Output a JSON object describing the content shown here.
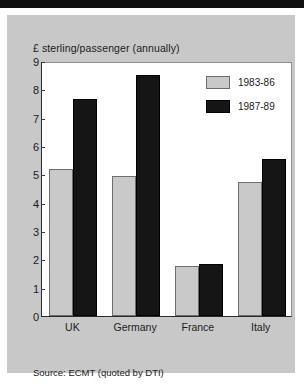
{
  "figure": {
    "background_color": "#c8c8c8",
    "plot_background_color": "#ffffff",
    "title": "£ sterling/passenger (annually)",
    "source_note": "Source: ECMT (quoted by DTI)"
  },
  "chart_data": {
    "type": "bar",
    "title": "£ sterling/passenger (annually)",
    "xlabel": "",
    "ylabel": "£ sterling/passenger (annually)",
    "ylim": [
      0,
      9
    ],
    "yticks": [
      0,
      1,
      2,
      3,
      4,
      5,
      6,
      7,
      8,
      9
    ],
    "ytick_labels": [
      "0",
      "1",
      "2",
      "3",
      "4",
      "5",
      "6",
      "7",
      "8",
      "9"
    ],
    "grid": false,
    "legend_position": "top-right",
    "categories": [
      "UK",
      "Germany",
      "France",
      "Italy"
    ],
    "series": [
      {
        "name": "1983-86",
        "color": "#c9c9c9",
        "values": [
          5.2,
          4.95,
          1.75,
          4.72
        ]
      },
      {
        "name": "1987-89",
        "color": "#151515",
        "values": [
          7.65,
          8.5,
          1.85,
          5.55
        ]
      }
    ],
    "annotations": [
      "Source: ECMT (quoted by DTI)"
    ]
  }
}
